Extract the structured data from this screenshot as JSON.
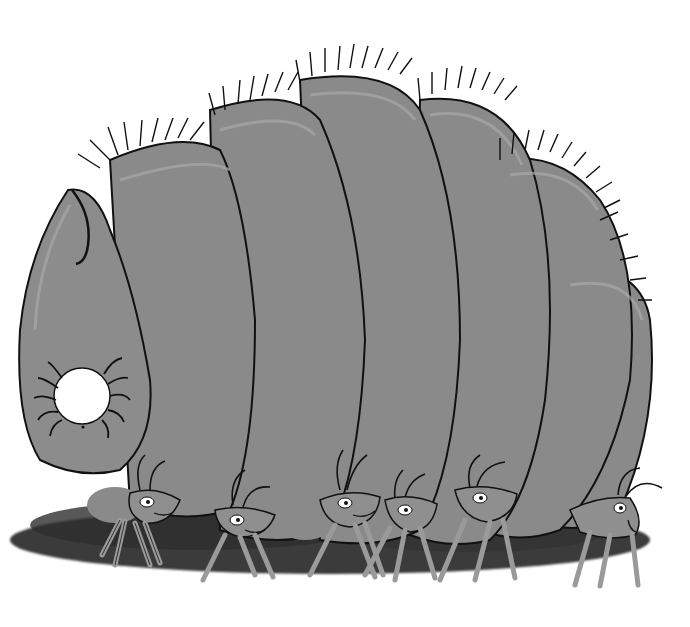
{
  "image": {
    "description": "Grayscale hand-drawn illustration of a large segmented larva (grub) being carried by a line of ants",
    "width": 690,
    "height": 627
  },
  "scene": {
    "subject": "segmented larva",
    "segments_count": 6,
    "carriers": "ants",
    "ants_count": 6,
    "head_detail": "spider-like creature with white round body on the larva head segment"
  },
  "colors": {
    "background": "#ffffff",
    "body_fill": "#8a8a8a",
    "body_highlight": "#a3a3a3",
    "outline": "#111111",
    "shadow": "#3a3a3a",
    "ant_fill": "#8f8f8f",
    "ant_leg": "#9a9a9a",
    "eye_white": "#ffffff",
    "spot_white": "#ffffff"
  }
}
